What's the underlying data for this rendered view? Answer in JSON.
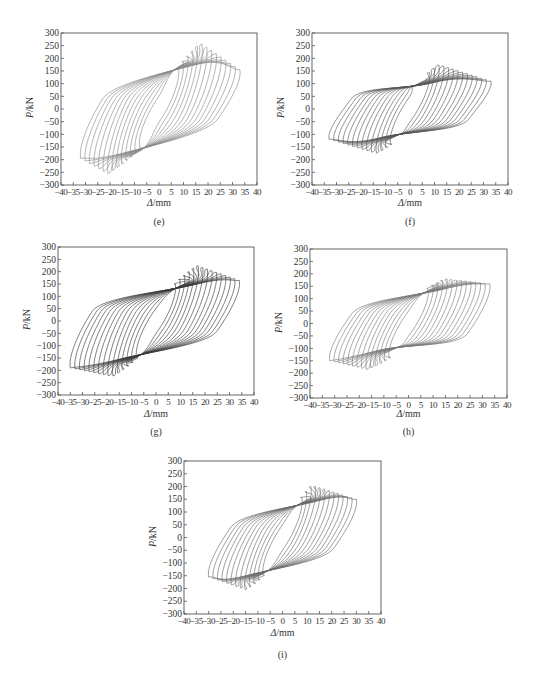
{
  "figure": {
    "panels": [
      "e",
      "f",
      "g",
      "h",
      "i"
    ]
  },
  "chart_data": [
    {
      "id": "e",
      "type": "line",
      "subtype": "hysteresis",
      "caption": "(e)",
      "xlabel_sym": "Δ",
      "xlabel_unit": "/mm",
      "ylabel_sym": "P",
      "ylabel_unit": "/kN",
      "xlim": [
        -40,
        40
      ],
      "ylim": [
        -300,
        300
      ],
      "xticks": [
        -40,
        -35,
        -30,
        -25,
        -20,
        -15,
        -10,
        -5,
        0,
        5,
        10,
        15,
        20,
        25,
        30,
        35,
        40
      ],
      "yticks": [
        300,
        250,
        200,
        150,
        100,
        50,
        0,
        -50,
        -100,
        -150,
        -200,
        -250,
        -300
      ],
      "grid": false,
      "line_color": "#8a8a8a",
      "pos_peak": {
        "disp": 17,
        "load": 260
      },
      "neg_peak": {
        "disp": -21,
        "load": -255
      },
      "pos_final": {
        "disp": 33,
        "load": 155
      },
      "neg_final": {
        "disp": -32,
        "load": -195
      },
      "pinch_point_pos": {
        "disp": 5,
        "load": 155
      },
      "pinch_point_neg": {
        "disp": -5,
        "load": -155
      },
      "cycles": 14
    },
    {
      "id": "f",
      "type": "line",
      "subtype": "hysteresis",
      "caption": "(f)",
      "xlabel_sym": "Δ",
      "xlabel_unit": "/mm",
      "ylabel_sym": "P",
      "ylabel_unit": "/kN",
      "xlim": [
        -40,
        40
      ],
      "ylim": [
        -300,
        300
      ],
      "xticks": [
        -40,
        -35,
        -30,
        -25,
        -20,
        -15,
        -10,
        -5,
        0,
        5,
        10,
        15,
        20,
        25,
        30,
        35,
        40
      ],
      "yticks": [
        300,
        250,
        200,
        150,
        100,
        50,
        0,
        -50,
        -100,
        -150,
        -200,
        -250,
        -300
      ],
      "grid": false,
      "line_color": "#555555",
      "pos_peak": {
        "disp": 12,
        "load": 175
      },
      "neg_peak": {
        "disp": -14,
        "load": -175
      },
      "pos_final": {
        "disp": 33,
        "load": 110
      },
      "neg_final": {
        "disp": -33,
        "load": -120
      },
      "pinch_point_pos": {
        "disp": 0,
        "load": 85
      },
      "pinch_point_neg": {
        "disp": -3,
        "load": -95
      },
      "cycles": 14
    },
    {
      "id": "g",
      "type": "line",
      "subtype": "hysteresis",
      "caption": "(g)",
      "xlabel_sym": "Δ",
      "xlabel_unit": "/mm",
      "ylabel_sym": "P",
      "ylabel_unit": "/kN",
      "xlim": [
        -40,
        40
      ],
      "ylim": [
        -300,
        300
      ],
      "xticks": [
        -40,
        -35,
        -30,
        -25,
        -20,
        -15,
        -10,
        -5,
        0,
        5,
        10,
        15,
        20,
        25,
        30,
        35,
        40
      ],
      "yticks": [
        300,
        250,
        200,
        150,
        100,
        50,
        0,
        -50,
        -100,
        -150,
        -200,
        -250,
        -300
      ],
      "grid": false,
      "line_color": "#3a3a3a",
      "pos_peak": {
        "disp": 17,
        "load": 225
      },
      "neg_peak": {
        "disp": -18,
        "load": -225
      },
      "pos_final": {
        "disp": 34,
        "load": 165
      },
      "neg_final": {
        "disp": -35,
        "load": -190
      },
      "pinch_point_pos": {
        "disp": 7,
        "load": 130
      },
      "pinch_point_neg": {
        "disp": -5,
        "load": -135
      },
      "cycles": 15
    },
    {
      "id": "h",
      "type": "line",
      "subtype": "hysteresis",
      "caption": "(h)",
      "xlabel_sym": "Δ",
      "xlabel_unit": "/mm",
      "ylabel_sym": "P",
      "ylabel_unit": "/kN",
      "xlim": [
        -40,
        40
      ],
      "ylim": [
        -300,
        300
      ],
      "xticks": [
        -40,
        -35,
        -30,
        -25,
        -20,
        -15,
        -10,
        -5,
        0,
        5,
        10,
        15,
        20,
        25,
        30,
        35,
        40
      ],
      "yticks": [
        300,
        250,
        200,
        150,
        100,
        50,
        0,
        -50,
        -100,
        -150,
        -200,
        -250,
        -300
      ],
      "grid": false,
      "line_color": "#7a7a7a",
      "pos_peak": {
        "disp": 15,
        "load": 180
      },
      "neg_peak": {
        "disp": -17,
        "load": -185
      },
      "pos_final": {
        "disp": 33,
        "load": 160
      },
      "neg_final": {
        "disp": -32,
        "load": -150
      },
      "pinch_point_pos": {
        "disp": 5,
        "load": 120
      },
      "pinch_point_neg": {
        "disp": -3,
        "load": -90
      },
      "cycles": 14
    },
    {
      "id": "i",
      "type": "line",
      "subtype": "hysteresis",
      "caption": "(i)",
      "xlabel_sym": "Δ",
      "xlabel_unit": "/mm",
      "ylabel_sym": "P",
      "ylabel_unit": "/kN",
      "xlim": [
        -40,
        40
      ],
      "ylim": [
        -300,
        300
      ],
      "xticks": [
        -40,
        -35,
        -30,
        -25,
        -20,
        -15,
        -10,
        -5,
        0,
        5,
        10,
        15,
        20,
        25,
        30,
        35,
        40
      ],
      "yticks": [
        300,
        250,
        200,
        150,
        100,
        50,
        0,
        -50,
        -100,
        -150,
        -200,
        -250,
        -300
      ],
      "grid": false,
      "line_color": "#6a6a6a",
      "pos_peak": {
        "disp": 12,
        "load": 205
      },
      "neg_peak": {
        "disp": -15,
        "load": -205
      },
      "pos_final": {
        "disp": 30,
        "load": 150
      },
      "neg_final": {
        "disp": -30,
        "load": -155
      },
      "pinch_point_pos": {
        "disp": 5,
        "load": 125
      },
      "pinch_point_neg": {
        "disp": -5,
        "load": -130
      },
      "cycles": 13
    }
  ],
  "layout": [
    {
      "id": "e",
      "frame": {
        "x": 61,
        "y": 33,
        "w": 196,
        "h": 152
      },
      "xlabel_y": 205,
      "caption_y": 224
    },
    {
      "id": "f",
      "frame": {
        "x": 312,
        "y": 33,
        "w": 196,
        "h": 152
      },
      "xlabel_y": 205,
      "caption_y": 224
    },
    {
      "id": "g",
      "frame": {
        "x": 58,
        "y": 247,
        "w": 196,
        "h": 148
      },
      "xlabel_y": 416,
      "caption_y": 434
    },
    {
      "id": "h",
      "frame": {
        "x": 310,
        "y": 249,
        "w": 197,
        "h": 149
      },
      "xlabel_y": 416,
      "caption_y": 434
    },
    {
      "id": "i",
      "frame": {
        "x": 184,
        "y": 461,
        "w": 197,
        "h": 153
      },
      "xlabel_y": 635,
      "caption_y": 657
    }
  ]
}
